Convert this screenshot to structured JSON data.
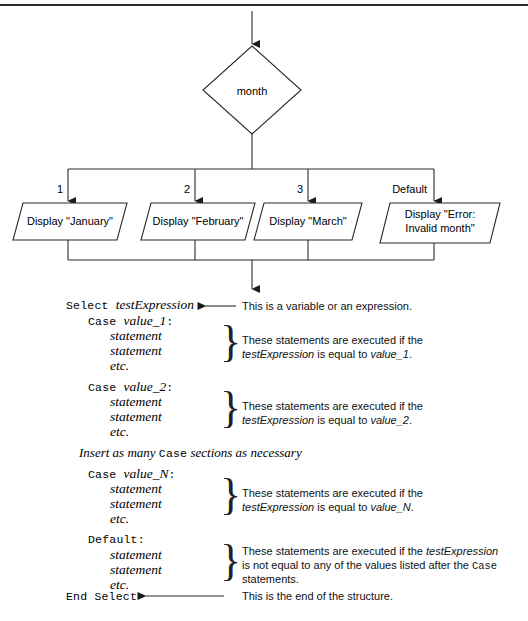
{
  "figure": {
    "stroke_color": "#2b2b2b",
    "text_color": "#000000",
    "background": "#ffffff"
  },
  "flowchart": {
    "decision": {
      "label": "month",
      "shape": "diamond"
    },
    "branches": [
      {
        "label": "1",
        "box": {
          "shape": "parallelogram",
          "lines": [
            "Display \"January\""
          ]
        }
      },
      {
        "label": "2",
        "box": {
          "shape": "parallelogram",
          "lines": [
            "Display \"February\""
          ]
        }
      },
      {
        "label": "3",
        "box": {
          "shape": "parallelogram",
          "lines": [
            "Display \"March\""
          ]
        }
      },
      {
        "label": "Default",
        "box": {
          "shape": "parallelogram",
          "lines": [
            "Display \"Error:",
            "Invalid month\""
          ]
        }
      }
    ]
  },
  "syntax": {
    "lines": [
      {
        "id": "select",
        "keyword": "Select",
        "identifier": "testExpression"
      },
      {
        "id": "case1",
        "keyword": "Case",
        "identifier": "value_1",
        "colon": ":"
      },
      {
        "id": "case1_s1",
        "identifier": "statement"
      },
      {
        "id": "case1_s2",
        "identifier": "statement"
      },
      {
        "id": "case1_etc",
        "identifier": "etc."
      },
      {
        "id": "case2",
        "keyword": "Case",
        "identifier": "value_2",
        "colon": ":"
      },
      {
        "id": "case2_s1",
        "identifier": "statement"
      },
      {
        "id": "case2_s2",
        "identifier": "statement"
      },
      {
        "id": "case2_etc",
        "identifier": "etc."
      },
      {
        "id": "insert_note",
        "text_a": "Insert as many ",
        "keyword": "Case",
        "text_b": " sections as necessary"
      },
      {
        "id": "caseN",
        "keyword": "Case",
        "identifier": "value_N",
        "colon": ":"
      },
      {
        "id": "caseN_s1",
        "identifier": "statement"
      },
      {
        "id": "caseN_s2",
        "identifier": "statement"
      },
      {
        "id": "caseN_etc",
        "identifier": "etc."
      },
      {
        "id": "default",
        "keyword": "Default:"
      },
      {
        "id": "def_s1",
        "identifier": "statement"
      },
      {
        "id": "def_s2",
        "identifier": "statement"
      },
      {
        "id": "def_etc",
        "identifier": "etc."
      },
      {
        "id": "end_select",
        "keyword": "End Select"
      }
    ]
  },
  "annotations": {
    "select_note": "This is a variable or an expression.",
    "case1_note": {
      "line1": "These statements are executed if the",
      "line2_a": "testExpression",
      "line2_b": " is equal to ",
      "line2_c": "value_1",
      "line2_d": "."
    },
    "case2_note": {
      "line1": "These statements are executed if the",
      "line2_a": "testExpression",
      "line2_b": " is equal to ",
      "line2_c": "value_2",
      "line2_d": "."
    },
    "caseN_note": {
      "line1": "These statements are executed if the",
      "line2_a": "testExpression",
      "line2_b": " is equal to ",
      "line2_c": "value_N",
      "line2_d": "."
    },
    "default_note": {
      "line1_a": "These statements are executed if the ",
      "line1_b": "testExpression",
      "line2_a": "is not equal to any of the values listed after the ",
      "line2_b": "Case",
      "line3": "statements."
    },
    "end_note": "This is the end of the structure."
  }
}
